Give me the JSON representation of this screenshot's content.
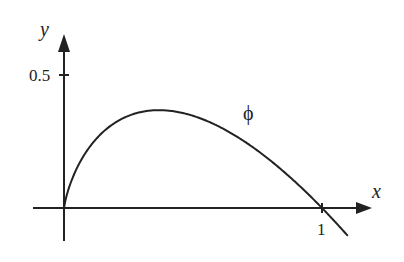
{
  "chart_data": {
    "type": "line",
    "title": "",
    "xlabel": "x",
    "ylabel": "y",
    "curve_label": "ϕ",
    "function": "phi(x) = -x ln x",
    "x_ticks": [
      {
        "value": 1,
        "label": "1"
      }
    ],
    "y_ticks": [
      {
        "value": 0.5,
        "label": "0.5"
      }
    ],
    "xlim": [
      -0.12,
      1.2
    ],
    "ylim": [
      -0.12,
      0.66
    ],
    "grid": false,
    "legend": null,
    "series": [
      {
        "name": "ϕ",
        "x": [
          0,
          0.02,
          0.05,
          0.1,
          0.15,
          0.2,
          0.25,
          0.3,
          0.368,
          0.45,
          0.5,
          0.6,
          0.7,
          0.8,
          0.9,
          1.0,
          1.1
        ],
        "y": [
          0,
          0.078,
          0.15,
          0.23,
          0.285,
          0.322,
          0.347,
          0.361,
          0.368,
          0.359,
          0.347,
          0.306,
          0.25,
          0.179,
          0.095,
          0.0,
          -0.105
        ]
      }
    ],
    "peak": {
      "x": 0.368,
      "y": 0.368
    }
  },
  "labels": {
    "x_axis": "x",
    "y_axis": "y",
    "y_tick": "0.5",
    "x_tick": "1",
    "curve": "ϕ"
  },
  "colors": {
    "line": "#222222",
    "background": "#ffffff"
  }
}
